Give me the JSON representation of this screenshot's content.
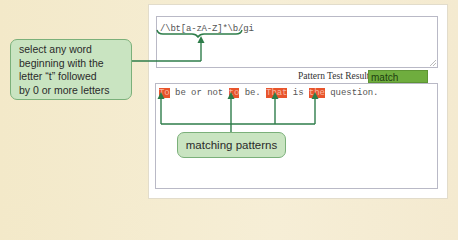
{
  "pattern_field": {
    "value": "/\\bt[a-zA-Z]*\\b/gi"
  },
  "result": {
    "label": "Pattern Test Result",
    "value": "match",
    "color": "#6fad3e"
  },
  "test_field": {
    "segments": [
      {
        "text": "To",
        "match": true
      },
      {
        "text": " be or not ",
        "match": false
      },
      {
        "text": "to",
        "match": true
      },
      {
        "text": " be. ",
        "match": false
      },
      {
        "text": "That",
        "match": true
      },
      {
        "text": " is ",
        "match": false
      },
      {
        "text": "the",
        "match": true
      },
      {
        "text": " question.",
        "match": false
      }
    ],
    "highlight_color": "#e8542c"
  },
  "callouts": {
    "pattern_description": [
      "select any word",
      "beginning with the",
      "letter “t” followed",
      "by 0 or more letters"
    ],
    "matches": "matching patterns"
  },
  "colors": {
    "callout_fill": "#c9e4c1",
    "connector": "#2e7d4a"
  }
}
